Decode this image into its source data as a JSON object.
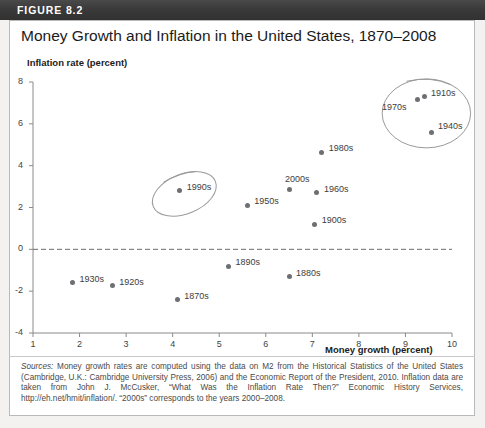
{
  "figure": {
    "label": "FIGURE 8.2",
    "title": "Money Growth and Inflation in the United States, 1870–2008"
  },
  "source_note": {
    "lead": "Sources:",
    "text": " Money growth rates are computed using the data on M2 from the Historical Statistics of the United States (Cambridge, U.K.: Cambridge University Press, 2006) and the Economic Report of the President, 2010. Inflation data are taken from John J. McCusker, “What Was the Inflation Rate Then?” Economic History Services, http://eh.net/hmit/inflation/. “2000s” corresponds to the years 2000–2008."
  },
  "colors": {
    "header_band": "#3b3b3b",
    "point": "#6d6f72",
    "axis": "#8a8a8a",
    "card": "#ffffff",
    "page": "#f3f2f0"
  },
  "chart_data": {
    "type": "scatter",
    "title": "Money Growth and Inflation in the United States, 1870–2008",
    "xlabel": "Money growth (percent)",
    "ylabel": "Inflation rate (percent)",
    "xlim": [
      1,
      10
    ],
    "ylim": [
      -4,
      8
    ],
    "xticks": [
      1,
      2,
      3,
      4,
      5,
      6,
      7,
      8,
      9,
      10
    ],
    "yticks": [
      -4,
      -2,
      0,
      2,
      4,
      6,
      8
    ],
    "grid": false,
    "legend": null,
    "zero_line": 0,
    "points": [
      {
        "label": "1870s",
        "x": 4.1,
        "y": -2.4,
        "label_dx": 7,
        "label_dy": -9
      },
      {
        "label": "1880s",
        "x": 6.5,
        "y": -1.3,
        "label_dx": 7,
        "label_dy": -9
      },
      {
        "label": "1890s",
        "x": 5.2,
        "y": -0.8,
        "label_dx": 7,
        "label_dy": -9
      },
      {
        "label": "1900s",
        "x": 7.05,
        "y": 1.2,
        "label_dx": 7,
        "label_dy": -9
      },
      {
        "label": "1910s",
        "x": 9.4,
        "y": 7.3,
        "label_dx": 7,
        "label_dy": -9
      },
      {
        "label": "1920s",
        "x": 2.7,
        "y": -1.75,
        "label_dx": 7,
        "label_dy": -9
      },
      {
        "label": "1930s",
        "x": 1.85,
        "y": -1.6,
        "label_dx": 7,
        "label_dy": -9
      },
      {
        "label": "1940s",
        "x": 9.55,
        "y": 5.6,
        "label_dx": 7,
        "label_dy": -11
      },
      {
        "label": "1950s",
        "x": 5.6,
        "y": 2.1,
        "label_dx": 7,
        "label_dy": -9
      },
      {
        "label": "1960s",
        "x": 7.1,
        "y": 2.7,
        "label_dx": 7,
        "label_dy": -9
      },
      {
        "label": "1970s",
        "x": 9.25,
        "y": 7.15,
        "label_dx": -35,
        "label_dy": 2
      },
      {
        "label": "1980s",
        "x": 7.2,
        "y": 4.65,
        "label_dx": 7,
        "label_dy": -9
      },
      {
        "label": "1990s",
        "x": 4.15,
        "y": 2.8,
        "label_dx": 7,
        "label_dy": -9
      },
      {
        "label": "2000s",
        "x": 6.5,
        "y": 2.85,
        "label_dx": -4,
        "label_dy": -16
      }
    ],
    "annotations": [
      {
        "type": "ellipse",
        "name": "circle-1990s",
        "cx": 4.25,
        "cy": 2.65,
        "rx": 0.72,
        "ry": 0.95,
        "rotation": -22
      },
      {
        "type": "ellipse",
        "name": "circle-high-inflation",
        "cx": 9.45,
        "cy": 6.5,
        "rx": 0.95,
        "ry": 1.65,
        "rotation": 0
      }
    ]
  }
}
